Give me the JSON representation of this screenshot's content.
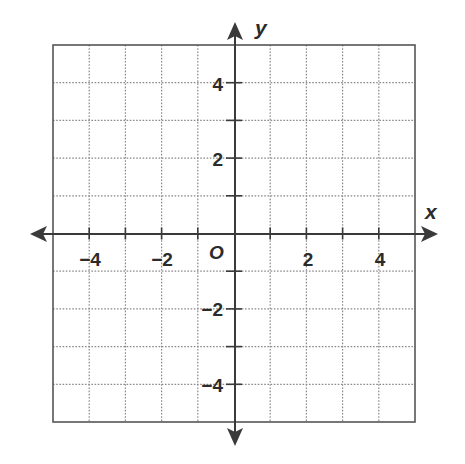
{
  "figure": {
    "type": "coordinate-plane"
  },
  "axes": {
    "x_label": "x",
    "y_label": "y",
    "origin_label": "O",
    "x_range": [
      -5,
      5
    ],
    "y_range": [
      -5,
      5
    ],
    "grid_step": 1,
    "label_step": 2
  },
  "x_tick_labels": [
    {
      "value": -4,
      "text": "−4"
    },
    {
      "value": -2,
      "text": "−2"
    },
    {
      "value": 2,
      "text": "2"
    },
    {
      "value": 4,
      "text": "4"
    }
  ],
  "y_tick_labels": [
    {
      "value": 4,
      "text": "4"
    },
    {
      "value": 2,
      "text": "2"
    },
    {
      "value": -2,
      "text": "−2"
    },
    {
      "value": -4,
      "text": "−4"
    }
  ],
  "colors": {
    "axis": "#3a3a3a",
    "border": "#555555",
    "grid": "#8a8a8a",
    "text": "#2b2b2b",
    "background": "#ffffff"
  }
}
